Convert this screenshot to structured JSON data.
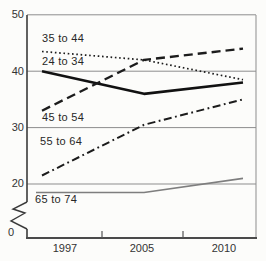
{
  "figure": {
    "background": "#fcfcfa",
    "line_color": "#1c1c1c",
    "gray_line_color": "#7e7e7e",
    "grid_color": "#8d8d8d"
  },
  "chart_data": {
    "type": "line",
    "title": "",
    "xlabel": "",
    "ylabel": "",
    "x_categories": [
      "1997",
      "2005",
      "2010"
    ],
    "y_tick_labels": [
      "50",
      "40",
      "30",
      "20",
      "0"
    ],
    "y_ticks_values": [
      50,
      40,
      30,
      20,
      0
    ],
    "ylim": [
      0,
      50
    ],
    "y_axis_break_between": [
      0,
      20
    ],
    "grid": "horizontal",
    "legend": "inline-labels",
    "series": [
      {
        "name": "35 to 44",
        "style": "dotted",
        "color": "#1c1c1c",
        "values": [
          43.5,
          42,
          38.5
        ]
      },
      {
        "name": "24 to 34",
        "style": "solid-thick",
        "color": "#111111",
        "values": [
          40,
          36,
          38
        ]
      },
      {
        "name": "45 to 54",
        "style": "dashed",
        "color": "#1c1c1c",
        "values": [
          33,
          42,
          44
        ]
      },
      {
        "name": "55 to 64",
        "style": "dash-dot",
        "color": "#1c1c1c",
        "values": [
          21.5,
          30.5,
          35
        ]
      },
      {
        "name": "65 to 74",
        "style": "solid-thin",
        "color": "#7e7e7e",
        "values": [
          18.5,
          18.5,
          21
        ]
      }
    ]
  }
}
